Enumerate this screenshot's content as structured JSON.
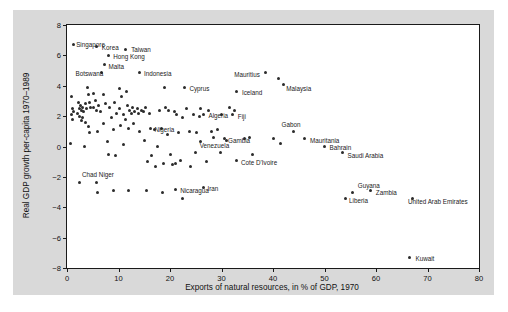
{
  "chart_data": {
    "type": "scatter",
    "title": "",
    "xlabel": "Exports of natural resources, in % of GDP, 1970",
    "ylabel": "Real GDP growth per-capita 1970–1989",
    "xlim": [
      0,
      80
    ],
    "ylim": [
      -8,
      8
    ],
    "xticks": [
      0,
      10,
      20,
      30,
      40,
      50,
      60,
      70,
      80
    ],
    "yticks": [
      8,
      6,
      4,
      2,
      0,
      -2,
      -4,
      -6,
      -8
    ],
    "grid": false,
    "legend": null,
    "marker_color": "#2b2b2b",
    "panel_color": "#ffffff",
    "figure_color": "#d9d9d9",
    "labeled_points": [
      {
        "name": "Singapore",
        "x": 1.2,
        "y": 6.7,
        "lx": 3,
        "ly": 0
      },
      {
        "name": "Korea",
        "x": 5.8,
        "y": 6.6,
        "lx": 5,
        "ly": 1
      },
      {
        "name": "Taiwan",
        "x": 11.3,
        "y": 6.4,
        "lx": 6,
        "ly": 0
      },
      {
        "name": "Hong Kong",
        "x": 8.0,
        "y": 6.0,
        "lx": 5,
        "ly": 1
      },
      {
        "name": "Malta",
        "x": 7.3,
        "y": 5.4,
        "lx": 4,
        "ly": 2
      },
      {
        "name": "Botswana",
        "x": 6.7,
        "y": 4.9,
        "lx": -26,
        "ly": 1
      },
      {
        "name": "Indonesia",
        "x": 14.0,
        "y": 4.9,
        "lx": 5,
        "ly": 1
      },
      {
        "name": "Mauritius",
        "x": 38.5,
        "y": 4.9,
        "lx": -31,
        "ly": 2
      },
      {
        "name": "Cyprus",
        "x": 22.8,
        "y": 3.9,
        "lx": 5,
        "ly": 1
      },
      {
        "name": "Malaysia",
        "x": 42.0,
        "y": 4.1,
        "lx": 3,
        "ly": 4
      },
      {
        "name": "Iceland",
        "x": 33.0,
        "y": 3.6,
        "lx": 5,
        "ly": 1
      },
      {
        "name": "Algeria",
        "x": 26.5,
        "y": 2.1,
        "lx": 5,
        "ly": 1
      },
      {
        "name": "Fiji",
        "x": 32.2,
        "y": 2.1,
        "lx": 5,
        "ly": 2
      },
      {
        "name": "Nigeria",
        "x": 16.2,
        "y": 1.2,
        "lx": 4,
        "ly": 1
      },
      {
        "name": "Gabon",
        "x": 44.0,
        "y": 1.0,
        "lx": -12,
        "ly": -7
      },
      {
        "name": "Gambia",
        "x": 30.5,
        "y": 0.5,
        "lx": 4,
        "ly": 2
      },
      {
        "name": "Mauritania",
        "x": 46.2,
        "y": 0.5,
        "lx": 5,
        "ly": 2
      },
      {
        "name": "Bahrain",
        "x": 50.0,
        "y": 0.0,
        "lx": 5,
        "ly": 1
      },
      {
        "name": "Saudi Arabia",
        "x": 53.5,
        "y": -0.4,
        "lx": 5,
        "ly": 3
      },
      {
        "name": "Venezuela",
        "x": 25.0,
        "y": -0.4,
        "lx": 4,
        "ly": -7
      },
      {
        "name": "Cote D'Ivoire",
        "x": 33.0,
        "y": -0.9,
        "lx": 4,
        "ly": 2
      },
      {
        "name": "Chad",
        "x": 2.5,
        "y": -2.4,
        "lx": 2,
        "ly": -8
      },
      {
        "name": "Niger",
        "x": 5.8,
        "y": -2.4,
        "lx": 2,
        "ly": -8
      },
      {
        "name": "Nicaragua",
        "x": 21.0,
        "y": -2.8,
        "lx": 5,
        "ly": 1
      },
      {
        "name": "Iran",
        "x": 26.5,
        "y": -2.7,
        "lx": 4,
        "ly": 1
      },
      {
        "name": "Guyana",
        "x": 55.5,
        "y": -3.0,
        "lx": 5,
        "ly": -7
      },
      {
        "name": "Zambia",
        "x": 59.0,
        "y": -2.9,
        "lx": 5,
        "ly": 2
      },
      {
        "name": "Liberia",
        "x": 54.0,
        "y": -3.4,
        "lx": 4,
        "ly": 2
      },
      {
        "name": "United Arab Emirates",
        "x": 67.0,
        "y": -3.4,
        "lx": -4,
        "ly": 3
      },
      {
        "name": "Kuwait",
        "x": 66.5,
        "y": -7.3,
        "lx": 6,
        "ly": 1
      }
    ],
    "unlabeled_points": [
      {
        "x": 0.8,
        "y": 3.3
      },
      {
        "x": 1.0,
        "y": 2.5
      },
      {
        "x": 1.3,
        "y": 2.3
      },
      {
        "x": 0.9,
        "y": 2.1
      },
      {
        "x": 1.1,
        "y": 1.8
      },
      {
        "x": 0.7,
        "y": 0.2
      },
      {
        "x": 2.2,
        "y": 2.9
      },
      {
        "x": 2.6,
        "y": 2.7
      },
      {
        "x": 2.4,
        "y": 2.5
      },
      {
        "x": 2.8,
        "y": 2.4
      },
      {
        "x": 2.1,
        "y": 2.2
      },
      {
        "x": 2.5,
        "y": 2.0
      },
      {
        "x": 3.0,
        "y": 2.6
      },
      {
        "x": 3.3,
        "y": 2.3
      },
      {
        "x": 3.1,
        "y": 1.9
      },
      {
        "x": 2.9,
        "y": 1.7
      },
      {
        "x": 3.5,
        "y": 2.8
      },
      {
        "x": 3.8,
        "y": 2.5
      },
      {
        "x": 3.6,
        "y": 1.6
      },
      {
        "x": 4.0,
        "y": 3.9
      },
      {
        "x": 4.2,
        "y": 3.4
      },
      {
        "x": 4.3,
        "y": 2.9
      },
      {
        "x": 4.6,
        "y": 2.6
      },
      {
        "x": 4.1,
        "y": 1.3
      },
      {
        "x": 4.4,
        "y": 0.9
      },
      {
        "x": 3.4,
        "y": 0.0
      },
      {
        "x": 5.2,
        "y": 3.5
      },
      {
        "x": 5.5,
        "y": 3.0
      },
      {
        "x": 5.1,
        "y": 2.6
      },
      {
        "x": 5.8,
        "y": 2.4
      },
      {
        "x": 6.2,
        "y": 2.7
      },
      {
        "x": 6.0,
        "y": 1.0
      },
      {
        "x": 6.5,
        "y": 2.3
      },
      {
        "x": 7.0,
        "y": 3.4
      },
      {
        "x": 7.4,
        "y": 2.8
      },
      {
        "x": 7.1,
        "y": 1.5
      },
      {
        "x": 7.8,
        "y": 0.3
      },
      {
        "x": 8.3,
        "y": 2.6
      },
      {
        "x": 8.6,
        "y": 1.9
      },
      {
        "x": 8.0,
        "y": -0.5
      },
      {
        "x": 9.2,
        "y": 2.9
      },
      {
        "x": 9.6,
        "y": 2.2
      },
      {
        "x": 9.0,
        "y": 1.1
      },
      {
        "x": 9.4,
        "y": -0.6
      },
      {
        "x": 10.2,
        "y": 3.8
      },
      {
        "x": 10.6,
        "y": 3.3
      },
      {
        "x": 10.1,
        "y": 2.5
      },
      {
        "x": 10.9,
        "y": 2.1
      },
      {
        "x": 10.4,
        "y": 1.4
      },
      {
        "x": 11.0,
        "y": 0.1
      },
      {
        "x": 11.5,
        "y": 3.6
      },
      {
        "x": 11.8,
        "y": 2.7
      },
      {
        "x": 11.3,
        "y": 1.8
      },
      {
        "x": 12.1,
        "y": 2.4
      },
      {
        "x": 12.5,
        "y": 2.2
      },
      {
        "x": 12.0,
        "y": 1.2
      },
      {
        "x": 12.8,
        "y": 2.6
      },
      {
        "x": 13.2,
        "y": 2.3
      },
      {
        "x": 13.6,
        "y": 2.5
      },
      {
        "x": 13.0,
        "y": 1.5
      },
      {
        "x": 13.9,
        "y": 2.2
      },
      {
        "x": 14.4,
        "y": 2.4
      },
      {
        "x": 14.1,
        "y": 1.0
      },
      {
        "x": 14.8,
        "y": 2.3
      },
      {
        "x": 15.2,
        "y": 2.6
      },
      {
        "x": 15.0,
        "y": 0.4
      },
      {
        "x": 15.6,
        "y": -1.0
      },
      {
        "x": 16.0,
        "y": 2.2
      },
      {
        "x": 16.5,
        "y": -0.6
      },
      {
        "x": 17.0,
        "y": 1.1
      },
      {
        "x": 17.5,
        "y": 0.0
      },
      {
        "x": 17.2,
        "y": -1.3
      },
      {
        "x": 18.0,
        "y": 2.4
      },
      {
        "x": 18.4,
        "y": 1.2
      },
      {
        "x": 18.8,
        "y": -1.1
      },
      {
        "x": 19.2,
        "y": 2.6
      },
      {
        "x": 19.8,
        "y": 2.4
      },
      {
        "x": 19.5,
        "y": 0.8
      },
      {
        "x": 20.0,
        "y": -0.5
      },
      {
        "x": 20.4,
        "y": -1.2
      },
      {
        "x": 20.8,
        "y": 2.3
      },
      {
        "x": 21.2,
        "y": 2.1
      },
      {
        "x": 21.6,
        "y": 0.9
      },
      {
        "x": 21.0,
        "y": -1.1
      },
      {
        "x": 22.0,
        "y": -0.9
      },
      {
        "x": 22.5,
        "y": 1.9
      },
      {
        "x": 23.2,
        "y": 2.5
      },
      {
        "x": 23.8,
        "y": 1.0
      },
      {
        "x": 24.0,
        "y": -1.3
      },
      {
        "x": 24.5,
        "y": 2.1
      },
      {
        "x": 25.2,
        "y": 0.9
      },
      {
        "x": 25.8,
        "y": 2.0
      },
      {
        "x": 26.0,
        "y": 0.3
      },
      {
        "x": 27.0,
        "y": -1.0
      },
      {
        "x": 28.0,
        "y": 1.0
      },
      {
        "x": 28.5,
        "y": 0.6
      },
      {
        "x": 29.2,
        "y": 1.1
      },
      {
        "x": 29.8,
        "y": -0.4
      },
      {
        "x": 30.0,
        "y": 2.1
      },
      {
        "x": 31.0,
        "y": 0.4
      },
      {
        "x": 34.5,
        "y": 0.5
      },
      {
        "x": 35.5,
        "y": 0.6
      },
      {
        "x": 36.0,
        "y": -0.5
      },
      {
        "x": 40.0,
        "y": 0.5
      },
      {
        "x": 41.5,
        "y": 0.2
      },
      {
        "x": 18.5,
        "y": -3.0
      },
      {
        "x": 15.5,
        "y": -2.9
      },
      {
        "x": 12.0,
        "y": -2.9
      },
      {
        "x": 9.0,
        "y": -2.9
      },
      {
        "x": 6.0,
        "y": -3.0
      },
      {
        "x": 22.5,
        "y": -3.4
      },
      {
        "x": 31.5,
        "y": 2.6
      },
      {
        "x": 32.5,
        "y": 2.4
      },
      {
        "x": 26.0,
        "y": 2.5
      },
      {
        "x": 27.5,
        "y": 2.4
      },
      {
        "x": 41.0,
        "y": 4.5
      },
      {
        "x": 19.0,
        "y": 3.9
      }
    ]
  }
}
